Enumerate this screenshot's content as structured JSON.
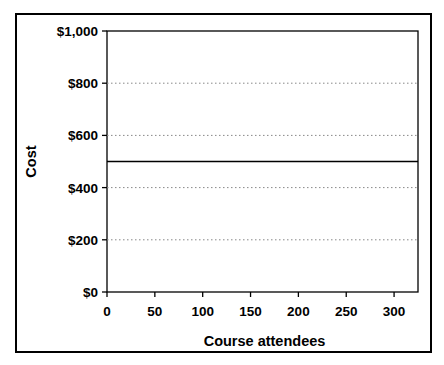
{
  "chart_data": {
    "type": "line",
    "title": "",
    "xlabel": "Course attendees",
    "ylabel": "Cost",
    "xlim": [
      0,
      325
    ],
    "ylim": [
      0,
      1000
    ],
    "x_ticks": [
      0,
      50,
      100,
      150,
      200,
      250,
      300
    ],
    "x_tick_labels": [
      "0",
      "50",
      "100",
      "150",
      "200",
      "250",
      "300"
    ],
    "y_ticks": [
      0,
      200,
      400,
      600,
      800,
      1000
    ],
    "y_tick_labels": [
      "$0",
      "$200",
      "$400",
      "$600",
      "$800",
      "$1,000"
    ],
    "grid": "horizontal dotted",
    "legend": "none",
    "series": [
      {
        "x": [
          0,
          325
        ],
        "y": [
          500,
          500
        ],
        "color": "#000000",
        "style": "solid"
      }
    ],
    "colors": {
      "background": "#ffffff",
      "frame": "#000000",
      "axis": "#000000",
      "gridline": "#888888",
      "text": "#000000"
    }
  }
}
